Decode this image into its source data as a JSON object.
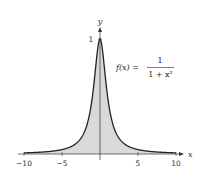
{
  "chart_data": {
    "type": "area",
    "function": "f(x) = 1/(1+x^2)",
    "x": [
      -10,
      -8,
      -6,
      -5,
      -4,
      -3,
      -2,
      -1.5,
      -1,
      -0.5,
      0,
      0.5,
      1,
      1.5,
      2,
      3,
      4,
      5,
      6,
      8,
      10
    ],
    "y": [
      0.0099,
      0.0154,
      0.027,
      0.0385,
      0.0588,
      0.1,
      0.2,
      0.3077,
      0.5,
      0.8,
      1,
      0.8,
      0.5,
      0.3077,
      0.2,
      0.1,
      0.0588,
      0.0385,
      0.027,
      0.0154,
      0.0099
    ],
    "shaded_region": {
      "from": -10,
      "to": 10
    },
    "title": "",
    "xlabel": "x",
    "ylabel": "y",
    "xlim": [
      -10,
      10
    ],
    "ylim": [
      0,
      1
    ],
    "xticks": [
      -10,
      -5,
      5,
      10
    ],
    "xtick_labels": [
      "−10",
      "−5",
      "5",
      "10"
    ],
    "yticks": [
      1
    ],
    "ytick_labels": [
      "1"
    ],
    "grid": false,
    "annotation": {
      "lhs": "f(x) =",
      "numerator": "1",
      "denominator": "1 + x²"
    },
    "colors": {
      "fill": "#d9d9d9",
      "curve": "#222222",
      "axis": "#333333"
    }
  }
}
